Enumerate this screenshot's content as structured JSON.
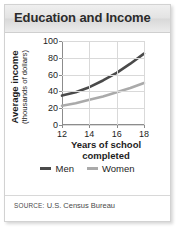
{
  "header": {
    "title": "Education and Income"
  },
  "source": {
    "keyword": "SOURCE:",
    "text": "U.S. Census Bureau"
  },
  "legend": {
    "items": [
      {
        "label": "Men",
        "color": "#4a4a4a"
      },
      {
        "label": "Women",
        "color": "#aaaaaa"
      }
    ]
  },
  "colors": {
    "men_line": "#4a4a4a",
    "women_line": "#aaaaaa",
    "grid": "#d9d9d9",
    "axis": "#8c8c8c",
    "header_text": "#2b2b2b"
  },
  "chart_data": {
    "type": "line",
    "title": "Education and Income",
    "xlabel": "Years of school completed",
    "ylabel": "Average income (thousands of dollars)",
    "ylabel_main": "Average income",
    "ylabel_sub": "(thousands of dollars)",
    "x": [
      12,
      13,
      14,
      15,
      16,
      17,
      18
    ],
    "xticks": [
      12,
      14,
      16,
      18
    ],
    "yticks": [
      0,
      20,
      40,
      60,
      80,
      100
    ],
    "xlim": [
      12,
      18
    ],
    "ylim": [
      0,
      100
    ],
    "grid": true,
    "legend_position": "bottom",
    "series": [
      {
        "name": "Men",
        "color": "#4a4a4a",
        "values": [
          35,
          39,
          45,
          53,
          62,
          73,
          85
        ]
      },
      {
        "name": "Women",
        "color": "#aaaaaa",
        "values": [
          23,
          26,
          30,
          34,
          39,
          44,
          50
        ]
      }
    ]
  }
}
